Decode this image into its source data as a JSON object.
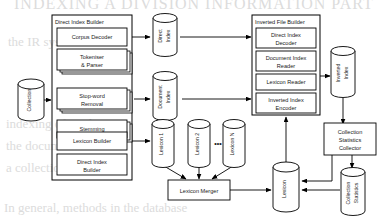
{
  "diagram": {
    "background_color": "#ffffff",
    "stroke_color": "#000000",
    "width": 390,
    "height": 221
  },
  "groups": {
    "direct_index_builder": {
      "title": "Direct Index Builder",
      "stages": [
        {
          "id": "corpus-decoder",
          "label_line1": "Corpus Decoder",
          "label_line2": "",
          "stacked": false
        },
        {
          "id": "tokeniser-parser",
          "label_line1": "Tokeniser",
          "label_line2": "& Parser",
          "stacked": true
        },
        {
          "id": "stop-word-removal",
          "label_line1": "Stop-word",
          "label_line2": "Removal",
          "stacked": true
        },
        {
          "id": "stemming",
          "label_line1": "Stemming",
          "label_line2": "",
          "stacked": true
        },
        {
          "id": "lexicon-builder",
          "label_line1": "Lexicon Builder",
          "label_line2": "",
          "stacked": false
        },
        {
          "id": "direct-index-builder-stage",
          "label_line1": "Direct Index",
          "label_line2": "Builder",
          "stacked": false
        }
      ]
    },
    "inverted_file_builder": {
      "title": "Inverted File Builder",
      "stages": [
        {
          "id": "direct-index-decoder",
          "label_line1": "Direct Index",
          "label_line2": "Decoder"
        },
        {
          "id": "document-index-reader",
          "label_line1": "Document Index",
          "label_line2": "Reader"
        },
        {
          "id": "lexicon-reader",
          "label_line1": "Lexicon Reader",
          "label_line2": ""
        },
        {
          "id": "inverted-index-encoder",
          "label_line1": "Inverted Index",
          "label_line2": "Encoder"
        }
      ]
    }
  },
  "processes": [
    {
      "id": "lexicon-merger",
      "label": "Lexicon Merger"
    },
    {
      "id": "collection-statistics-collector",
      "label_line1": "Collection",
      "label_line2": "Statistics",
      "label_line3": "Collector"
    }
  ],
  "datastores": [
    {
      "id": "collection",
      "label_line1": "Collection",
      "label_line2": ""
    },
    {
      "id": "direct-index",
      "label_line1": "Direct",
      "label_line2": "Index"
    },
    {
      "id": "document-index",
      "label_line1": "Document",
      "label_line2": "Index"
    },
    {
      "id": "lexicon-1",
      "label_line1": "Lexicon 1",
      "label_line2": ""
    },
    {
      "id": "lexicon-2",
      "label_line1": "Lexicon 2",
      "label_line2": ""
    },
    {
      "id": "lexicon-n",
      "label_line1": "Lexicon N",
      "label_line2": ""
    },
    {
      "id": "inverted-index",
      "label_line1": "Inverted",
      "label_line2": "Index"
    },
    {
      "id": "lexicon",
      "label_line1": "Lexicon",
      "label_line2": ""
    },
    {
      "id": "collection-statistics",
      "label_line1": "Collection",
      "label_line2": "Statistics"
    }
  ],
  "annotations": {
    "lexicon_ellipsis": "•••"
  },
  "background_bleed": {
    "line_top": "INDEXING A DIVISION INFORMATION PART",
    "line_a": "the IR system",
    "line_b": "indexing of modern",
    "line_c": "the document",
    "line_d": "a collection of terms",
    "line_e": "In general, methods in the database"
  }
}
